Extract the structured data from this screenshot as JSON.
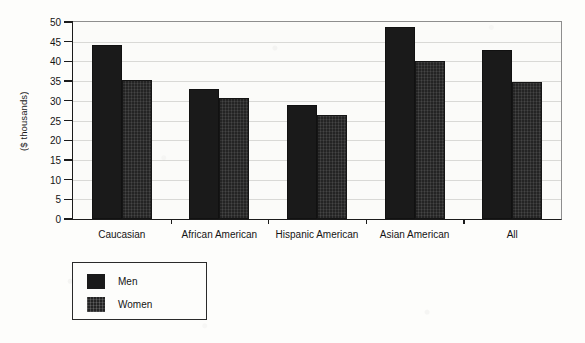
{
  "chart_data": {
    "type": "bar",
    "title": "",
    "subtitle": "",
    "xlabel": "",
    "ylabel": "($ thousands)",
    "ylim": [
      0,
      50
    ],
    "yticks": [
      0,
      5,
      10,
      15,
      20,
      25,
      30,
      35,
      40,
      45,
      50
    ],
    "ytick_labels": [
      "0",
      "5",
      "10",
      "15",
      "20",
      "25",
      "30",
      "35",
      "40",
      "45",
      "50"
    ],
    "grid": true,
    "legend_position": "below-left",
    "categories": [
      "Caucasian",
      "African American",
      "Hispanic American",
      "Asian American",
      "All"
    ],
    "series": [
      {
        "name": "Men",
        "color": "#1a1a1a",
        "values": [
          44.2,
          32.9,
          29.0,
          48.7,
          42.8
        ]
      },
      {
        "name": "Women",
        "color": "#242424",
        "values": [
          35.4,
          30.7,
          26.3,
          40.2,
          34.7
        ]
      }
    ]
  },
  "legend": {
    "items": [
      {
        "label": "Men",
        "swatch": "men"
      },
      {
        "label": "Women",
        "swatch": "women"
      }
    ]
  }
}
